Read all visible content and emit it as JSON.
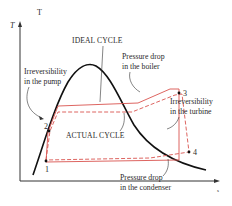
{
  "figure": {
    "type": "T-s diagram",
    "axes": {
      "y_label": "T",
      "x_label": "s",
      "corner_glyph": "T"
    },
    "labels": {
      "ideal_cycle": "IDEAL CYCLE",
      "actual_cycle": "ACTUAL CYCLE",
      "pump_line1": "Irreversibility",
      "pump_line2": "in the pump",
      "boiler_line1": "Pressure drop",
      "boiler_line2": "in the boiler",
      "turbine_line1": "Irreversibility",
      "turbine_line2": "in the turbine",
      "condenser_line1": "Pressure drop",
      "condenser_line2": "in the condenser"
    },
    "states": [
      {
        "id": "1",
        "label": "1"
      },
      {
        "id": "2",
        "label": "2"
      },
      {
        "id": "3",
        "label": "3"
      },
      {
        "id": "4",
        "label": "4"
      }
    ],
    "colors": {
      "dome": "#111111",
      "ideal_cycle": "#d9534f",
      "actual_cycle": "#d9534f",
      "text": "#2a2a2a",
      "axis": "#333333"
    }
  }
}
